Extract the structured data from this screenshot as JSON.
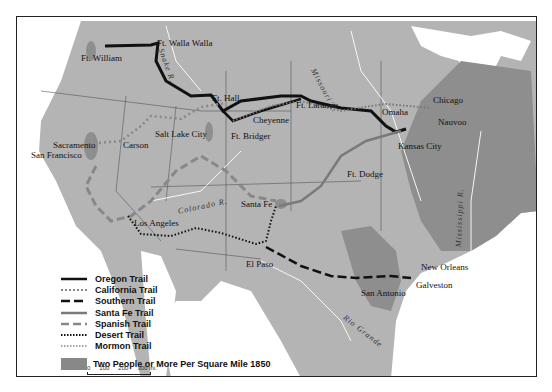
{
  "map": {
    "places": [
      {
        "name": "Ft. William",
        "x": 78,
        "y": 50
      },
      {
        "name": "Ft. Walla Walla",
        "x": 157,
        "y": 37
      },
      {
        "name": "Ft. Hall",
        "x": 211,
        "y": 89
      },
      {
        "name": "Salt Lake City",
        "x": 154,
        "y": 129
      },
      {
        "name": "Ft. Bridger",
        "x": 230,
        "y": 132
      },
      {
        "name": "Cheyenne",
        "x": 252,
        "y": 115
      },
      {
        "name": "Ft. Laramie",
        "x": 295,
        "y": 100
      },
      {
        "name": "Omaha",
        "x": 381,
        "y": 107
      },
      {
        "name": "Chicago",
        "x": 432,
        "y": 95
      },
      {
        "name": "Nauvoo",
        "x": 437,
        "y": 117
      },
      {
        "name": "Kansas City",
        "x": 397,
        "y": 141
      },
      {
        "name": "Ft. Dodge",
        "x": 346,
        "y": 169
      },
      {
        "name": "Sacramento",
        "x": 52,
        "y": 140
      },
      {
        "name": "Carson",
        "x": 122,
        "y": 140
      },
      {
        "name": "San Francisco",
        "x": 30,
        "y": 150
      },
      {
        "name": "Santa Fe",
        "x": 240,
        "y": 199
      },
      {
        "name": "Los Angeles",
        "x": 133,
        "y": 218
      },
      {
        "name": "El Paso",
        "x": 245,
        "y": 259
      },
      {
        "name": "San Antonio",
        "x": 360,
        "y": 288
      },
      {
        "name": "Galveston",
        "x": 415,
        "y": 280
      },
      {
        "name": "New Orleans",
        "x": 420,
        "y": 262
      }
    ],
    "rivers": [
      "Snake R.",
      "Missouri R.",
      "Colorado R.",
      "Mississippi R.",
      "Rio Grande"
    ]
  },
  "legend": {
    "items": [
      {
        "label": "Oregon Trail",
        "style": "solid-black"
      },
      {
        "label": "California Trail",
        "style": "dotted-gray"
      },
      {
        "label": "Southern Trail",
        "style": "dashed-black"
      },
      {
        "label": "Santa Fe Trail",
        "style": "solid-gray"
      },
      {
        "label": "Spanish Trail",
        "style": "dashed-gray"
      },
      {
        "label": "Desert Trail",
        "style": "dotted-black"
      },
      {
        "label": "Mormon Trail",
        "style": "dotted-gray-fine"
      }
    ],
    "density_label": "Two People or More Per Square Mile 1850"
  },
  "scale": {
    "ticks": [
      "0",
      "100",
      "200",
      "300 mi."
    ]
  },
  "colors": {
    "land": "#b4b4b4",
    "dense": "#8e8e8e",
    "water": "#ffffff",
    "trail_black": "#111111",
    "trail_gray": "#7a7a7a"
  }
}
